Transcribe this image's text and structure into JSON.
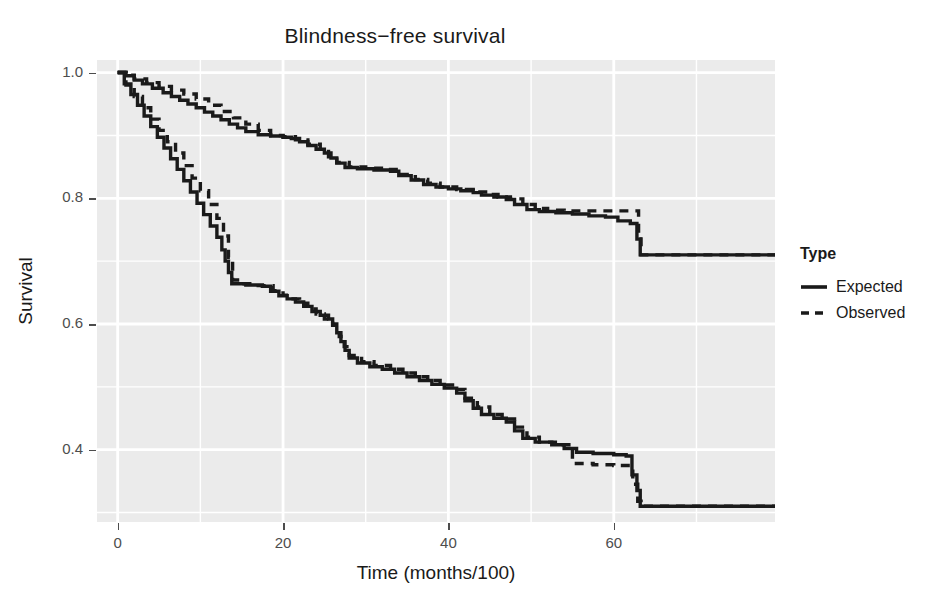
{
  "chart_data": {
    "type": "line",
    "title": "Blindness−free survival",
    "xlabel": "Time (months/100)",
    "ylabel": "Survival",
    "xlim": [
      -2.5,
      79.5
    ],
    "ylim": [
      0.285,
      1.02
    ],
    "xticks": [
      0,
      20,
      40,
      60
    ],
    "yticks": [
      0.4,
      0.6,
      0.8,
      1.0
    ],
    "xtick_labels": [
      "0",
      "20",
      "40",
      "60"
    ],
    "ytick_labels": [
      "0.4",
      "0.6",
      "0.8",
      "1.0"
    ],
    "x_minor_ticks": [
      10,
      30,
      50,
      70
    ],
    "y_minor_ticks": [
      0.3,
      0.5,
      0.7,
      0.9
    ],
    "grid": true,
    "grid_color": "#ffffff",
    "panel_background": "#ebebeb",
    "legend": {
      "title": "Type",
      "position": "right",
      "entries": [
        {
          "name": "Expected",
          "style": "solid",
          "color": "#1a1a1a"
        },
        {
          "name": "Observed",
          "style": "dashed",
          "color": "#1a1a1a"
        }
      ]
    },
    "series": [
      {
        "name": "Expected (upper group)",
        "group": "upper",
        "style": "solid",
        "color": "#1a1a1a",
        "step": "post",
        "points": [
          [
            0.0,
            1.0
          ],
          [
            1.0,
            0.995
          ],
          [
            2.0,
            0.988
          ],
          [
            3.0,
            0.982
          ],
          [
            4.2,
            0.975
          ],
          [
            5.5,
            0.968
          ],
          [
            6.5,
            0.962
          ],
          [
            7.5,
            0.956
          ],
          [
            8.5,
            0.95
          ],
          [
            9.5,
            0.944
          ],
          [
            10.5,
            0.937
          ],
          [
            11.5,
            0.931
          ],
          [
            12.5,
            0.925
          ],
          [
            13.5,
            0.918
          ],
          [
            14.5,
            0.912
          ],
          [
            15.5,
            0.906
          ],
          [
            17.0,
            0.901
          ],
          [
            18.5,
            0.899
          ],
          [
            20.0,
            0.897
          ],
          [
            21.0,
            0.895
          ],
          [
            22.0,
            0.89
          ],
          [
            23.0,
            0.884
          ],
          [
            24.0,
            0.878
          ],
          [
            25.0,
            0.872
          ],
          [
            25.8,
            0.864
          ],
          [
            26.5,
            0.856
          ],
          [
            27.5,
            0.849
          ],
          [
            29.0,
            0.847
          ],
          [
            31.0,
            0.845
          ],
          [
            33.0,
            0.843
          ],
          [
            34.0,
            0.836
          ],
          [
            35.5,
            0.829
          ],
          [
            37.0,
            0.822
          ],
          [
            38.5,
            0.818
          ],
          [
            40.0,
            0.815
          ],
          [
            41.5,
            0.812
          ],
          [
            43.0,
            0.809
          ],
          [
            44.0,
            0.805
          ],
          [
            45.5,
            0.802
          ],
          [
            47.0,
            0.798
          ],
          [
            48.0,
            0.79
          ],
          [
            49.5,
            0.782
          ],
          [
            51.0,
            0.779
          ],
          [
            53.0,
            0.777
          ],
          [
            55.0,
            0.775
          ],
          [
            57.0,
            0.772
          ],
          [
            59.0,
            0.77
          ],
          [
            60.5,
            0.764
          ],
          [
            62.0,
            0.76
          ],
          [
            62.8,
            0.735
          ],
          [
            63.2,
            0.71
          ],
          [
            79.5,
            0.71
          ]
        ]
      },
      {
        "name": "Observed (upper group)",
        "group": "upper",
        "style": "dashed",
        "color": "#1a1a1a",
        "step": "post",
        "points": [
          [
            0.0,
            1.0
          ],
          [
            1.0,
            0.996
          ],
          [
            2.0,
            0.99
          ],
          [
            3.5,
            0.984
          ],
          [
            5.0,
            0.978
          ],
          [
            6.5,
            0.972
          ],
          [
            8.0,
            0.966
          ],
          [
            9.5,
            0.958
          ],
          [
            11.0,
            0.948
          ],
          [
            12.5,
            0.938
          ],
          [
            14.0,
            0.928
          ],
          [
            15.5,
            0.918
          ],
          [
            17.0,
            0.908
          ],
          [
            18.5,
            0.9
          ],
          [
            20.0,
            0.898
          ],
          [
            21.5,
            0.893
          ],
          [
            23.0,
            0.886
          ],
          [
            24.5,
            0.878
          ],
          [
            25.5,
            0.866
          ],
          [
            26.5,
            0.857
          ],
          [
            28.0,
            0.85
          ],
          [
            30.0,
            0.848
          ],
          [
            32.5,
            0.846
          ],
          [
            34.0,
            0.838
          ],
          [
            36.0,
            0.83
          ],
          [
            37.5,
            0.824
          ],
          [
            39.0,
            0.818
          ],
          [
            41.0,
            0.814
          ],
          [
            43.0,
            0.81
          ],
          [
            44.5,
            0.806
          ],
          [
            46.0,
            0.802
          ],
          [
            47.5,
            0.799
          ],
          [
            49.0,
            0.79
          ],
          [
            50.5,
            0.784
          ],
          [
            52.0,
            0.781
          ],
          [
            54.0,
            0.78
          ],
          [
            57.0,
            0.78
          ],
          [
            60.0,
            0.78
          ],
          [
            62.8,
            0.78
          ],
          [
            63.0,
            0.745
          ],
          [
            63.3,
            0.71
          ],
          [
            79.5,
            0.71
          ]
        ]
      },
      {
        "name": "Expected (lower group)",
        "group": "lower",
        "style": "solid",
        "color": "#1a1a1a",
        "step": "post",
        "points": [
          [
            0.0,
            1.0
          ],
          [
            0.8,
            0.982
          ],
          [
            1.6,
            0.965
          ],
          [
            2.4,
            0.948
          ],
          [
            3.2,
            0.931
          ],
          [
            4.0,
            0.914
          ],
          [
            4.8,
            0.897
          ],
          [
            5.6,
            0.88
          ],
          [
            6.4,
            0.863
          ],
          [
            7.2,
            0.846
          ],
          [
            8.0,
            0.828
          ],
          [
            8.8,
            0.81
          ],
          [
            9.6,
            0.792
          ],
          [
            10.4,
            0.774
          ],
          [
            11.2,
            0.756
          ],
          [
            12.0,
            0.738
          ],
          [
            12.6,
            0.718
          ],
          [
            13.0,
            0.7
          ],
          [
            13.4,
            0.682
          ],
          [
            13.8,
            0.664
          ],
          [
            15.5,
            0.662
          ],
          [
            17.5,
            0.66
          ],
          [
            18.5,
            0.652
          ],
          [
            19.5,
            0.645
          ],
          [
            20.5,
            0.64
          ],
          [
            21.5,
            0.635
          ],
          [
            22.5,
            0.628
          ],
          [
            23.5,
            0.62
          ],
          [
            24.5,
            0.614
          ],
          [
            25.5,
            0.608
          ],
          [
            26.0,
            0.6
          ],
          [
            26.5,
            0.586
          ],
          [
            27.0,
            0.572
          ],
          [
            27.5,
            0.558
          ],
          [
            28.0,
            0.546
          ],
          [
            29.0,
            0.538
          ],
          [
            30.5,
            0.532
          ],
          [
            32.0,
            0.528
          ],
          [
            33.5,
            0.522
          ],
          [
            35.0,
            0.516
          ],
          [
            36.5,
            0.51
          ],
          [
            38.0,
            0.504
          ],
          [
            39.5,
            0.498
          ],
          [
            41.0,
            0.49
          ],
          [
            42.0,
            0.478
          ],
          [
            43.0,
            0.466
          ],
          [
            44.0,
            0.456
          ],
          [
            45.5,
            0.45
          ],
          [
            47.0,
            0.444
          ],
          [
            48.0,
            0.43
          ],
          [
            49.0,
            0.418
          ],
          [
            50.5,
            0.412
          ],
          [
            52.5,
            0.408
          ],
          [
            54.0,
            0.402
          ],
          [
            55.5,
            0.396
          ],
          [
            57.5,
            0.394
          ],
          [
            60.0,
            0.392
          ],
          [
            61.5,
            0.39
          ],
          [
            62.2,
            0.36
          ],
          [
            62.8,
            0.335
          ],
          [
            63.2,
            0.31
          ],
          [
            79.5,
            0.31
          ]
        ]
      },
      {
        "name": "Observed (lower group)",
        "group": "lower",
        "style": "dashed",
        "color": "#1a1a1a",
        "step": "post",
        "points": [
          [
            0.0,
            1.0
          ],
          [
            1.0,
            0.98
          ],
          [
            2.0,
            0.962
          ],
          [
            3.0,
            0.944
          ],
          [
            4.0,
            0.926
          ],
          [
            5.0,
            0.908
          ],
          [
            6.0,
            0.89
          ],
          [
            7.0,
            0.872
          ],
          [
            8.0,
            0.852
          ],
          [
            9.0,
            0.832
          ],
          [
            10.0,
            0.812
          ],
          [
            11.0,
            0.79
          ],
          [
            12.0,
            0.768
          ],
          [
            12.8,
            0.74
          ],
          [
            13.4,
            0.706
          ],
          [
            13.9,
            0.67
          ],
          [
            15.0,
            0.664
          ],
          [
            17.0,
            0.661
          ],
          [
            18.8,
            0.653
          ],
          [
            20.0,
            0.646
          ],
          [
            21.0,
            0.64
          ],
          [
            22.0,
            0.633
          ],
          [
            23.0,
            0.624
          ],
          [
            24.0,
            0.616
          ],
          [
            25.0,
            0.608
          ],
          [
            26.0,
            0.598
          ],
          [
            26.8,
            0.58
          ],
          [
            27.4,
            0.564
          ],
          [
            28.0,
            0.55
          ],
          [
            29.5,
            0.54
          ],
          [
            31.0,
            0.534
          ],
          [
            33.0,
            0.528
          ],
          [
            34.5,
            0.522
          ],
          [
            36.0,
            0.516
          ],
          [
            37.5,
            0.51
          ],
          [
            39.0,
            0.503
          ],
          [
            40.5,
            0.496
          ],
          [
            42.0,
            0.482
          ],
          [
            43.5,
            0.468
          ],
          [
            45.0,
            0.456
          ],
          [
            46.5,
            0.449
          ],
          [
            48.0,
            0.436
          ],
          [
            49.5,
            0.42
          ],
          [
            51.0,
            0.412
          ],
          [
            53.5,
            0.408
          ],
          [
            55.0,
            0.378
          ],
          [
            57.5,
            0.376
          ],
          [
            60.0,
            0.375
          ],
          [
            61.8,
            0.375
          ],
          [
            62.3,
            0.345
          ],
          [
            62.9,
            0.318
          ],
          [
            63.3,
            0.31
          ],
          [
            79.5,
            0.31
          ]
        ]
      }
    ]
  }
}
